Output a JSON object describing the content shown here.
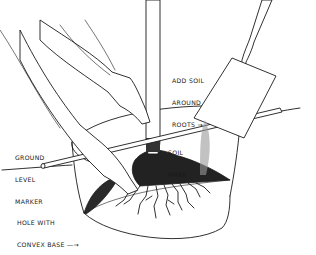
{
  "illustration": {
    "subject": "Planting a tree in a hole with convex base",
    "labels": {
      "add_soil": [
        "ADD SOIL",
        "AROUND",
        "ROOTS →"
      ],
      "ground_level_marker": [
        "GROUND",
        "LEVEL",
        "MARKER"
      ],
      "soil_mark": [
        "SOIL",
        "MARK"
      ],
      "hole": [
        "HOLE WITH",
        "CONVEX BASE —→"
      ]
    },
    "colors": {
      "ink": "#1a1a1a",
      "paper": "#ffffff",
      "soil_dark": "#2a2a2a"
    }
  }
}
